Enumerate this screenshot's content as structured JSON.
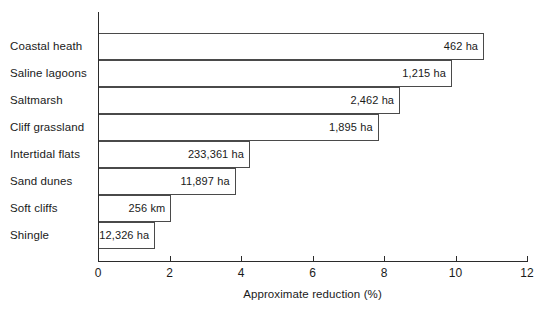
{
  "chart_data": {
    "type": "bar",
    "orientation": "horizontal",
    "title": "",
    "xlabel": "Approximate reduction (%)",
    "ylabel": "",
    "xlim": [
      0,
      12
    ],
    "xticks": [
      0,
      2,
      4,
      6,
      8,
      10,
      12
    ],
    "xtick_labels": [
      "0",
      "2",
      "4",
      "6",
      "8",
      "10",
      "12"
    ],
    "grid": false,
    "legend": "none",
    "categories": [
      "Coastal heath",
      "Saline lagoons",
      "Saltmarsh",
      "Cliff grassland",
      "Intertidal flats",
      "Sand dunes",
      "Soft cliffs",
      "Shingle"
    ],
    "values": [
      10.8,
      9.9,
      8.45,
      7.85,
      4.25,
      3.85,
      2.05,
      1.6
    ],
    "bar_annotations": [
      "462 ha",
      "1,215 ha",
      "2,462 ha",
      "1,895 ha",
      "233,361 ha",
      "11,897 ha",
      "256 km",
      "12,326 ha"
    ],
    "colors": {
      "bar_fill": "#ffffff",
      "bar_edge": "#4a4a4a",
      "axis": "#2b2b2b",
      "text": "#1a1a1a",
      "background": "#ffffff"
    }
  }
}
